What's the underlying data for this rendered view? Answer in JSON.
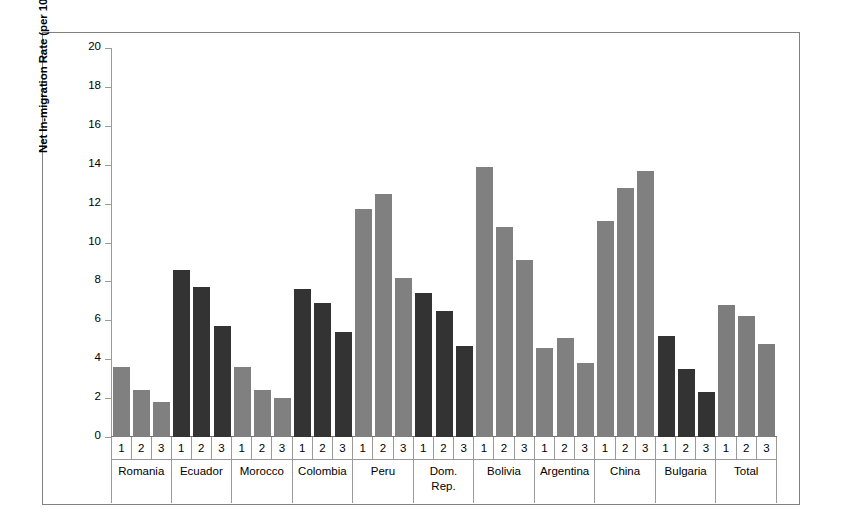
{
  "chart_data": {
    "type": "bar",
    "title": "",
    "xlabel": "",
    "ylabel": "Net In-migration Rate (per 100)*",
    "ylim": [
      0,
      20
    ],
    "ytick_labels": [
      "20",
      "18",
      "16",
      "14",
      "12",
      "10",
      "8",
      "6",
      "4",
      "2",
      "0"
    ],
    "ytick_values": [
      20,
      18,
      16,
      14,
      12,
      10,
      8,
      6,
      4,
      2,
      0
    ],
    "grid": false,
    "legend": "none",
    "period_labels": [
      "1",
      "2",
      "3"
    ],
    "categories": [
      "Romania",
      "Ecuador",
      "Morocco",
      "Colombia",
      "Peru",
      "Dom. Rep.",
      "Bolivia",
      "Argentina",
      "China",
      "Bulgaria",
      "Total"
    ],
    "groups": [
      {
        "name": "Romania",
        "name_lines": [
          "Romania"
        ],
        "color": "#808080",
        "values": [
          3.6,
          2.4,
          1.8
        ]
      },
      {
        "name": "Ecuador",
        "name_lines": [
          "Ecuador"
        ],
        "color": "#333333",
        "values": [
          8.6,
          7.7,
          5.7
        ]
      },
      {
        "name": "Morocco",
        "name_lines": [
          "Morocco"
        ],
        "color": "#808080",
        "values": [
          3.6,
          2.4,
          2.0
        ]
      },
      {
        "name": "Colombia",
        "name_lines": [
          "Colombia"
        ],
        "color": "#333333",
        "values": [
          7.6,
          6.9,
          5.4
        ]
      },
      {
        "name": "Peru",
        "name_lines": [
          "Peru"
        ],
        "color": "#808080",
        "values": [
          11.7,
          12.5,
          8.2
        ]
      },
      {
        "name": "Dom. Rep.",
        "name_lines": [
          "Dom.",
          "Rep."
        ],
        "color": "#333333",
        "values": [
          7.4,
          6.5,
          4.7
        ]
      },
      {
        "name": "Bolivia",
        "name_lines": [
          "Bolivia"
        ],
        "color": "#808080",
        "values": [
          13.9,
          10.8,
          9.1
        ]
      },
      {
        "name": "Argentina",
        "name_lines": [
          "Argentina"
        ],
        "color": "#808080",
        "values": [
          4.6,
          5.1,
          3.8
        ]
      },
      {
        "name": "China",
        "name_lines": [
          "China"
        ],
        "color": "#808080",
        "values": [
          11.1,
          12.8,
          13.7
        ]
      },
      {
        "name": "Bulgaria",
        "name_lines": [
          "Bulgaria"
        ],
        "color": "#333333",
        "values": [
          5.2,
          3.5,
          2.3
        ]
      },
      {
        "name": "Total",
        "name_lines": [
          "Total"
        ],
        "color": "#7d7d7d",
        "values": [
          6.8,
          6.2,
          4.8
        ]
      }
    ],
    "colors": {
      "light_gray": "#808080",
      "dark_gray": "#333333",
      "total_gray": "#7d7d7d"
    }
  }
}
